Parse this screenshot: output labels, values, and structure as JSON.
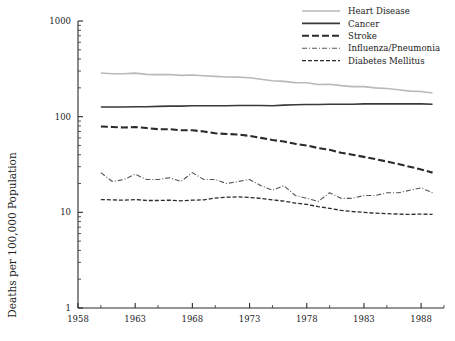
{
  "chart_data": {
    "type": "line",
    "title": "",
    "xlabel": "",
    "ylabel": "Deaths per 100,000 Population",
    "yscale": "log",
    "ylim": [
      1,
      1000
    ],
    "xlim": [
      1958,
      1990
    ],
    "grid": false,
    "legend_position": "top-right",
    "ytick_labels": [
      "1000",
      "100",
      "10",
      "1"
    ],
    "ytick_values": [
      1000,
      100,
      10,
      1
    ],
    "xtick_labels": [
      "1958",
      "1963",
      "1968",
      "1973",
      "1978",
      "1983",
      "1988"
    ],
    "xtick_values": [
      1958,
      1963,
      1968,
      1973,
      1978,
      1983,
      1988
    ],
    "x": [
      1960,
      1961,
      1962,
      1963,
      1964,
      1965,
      1966,
      1967,
      1968,
      1969,
      1970,
      1971,
      1972,
      1973,
      1974,
      1975,
      1976,
      1977,
      1978,
      1979,
      1980,
      1981,
      1982,
      1983,
      1984,
      1985,
      1986,
      1987,
      1988,
      1989
    ],
    "series": [
      {
        "name": "Heart Disease",
        "color": "#b9b9b9",
        "style": "solid",
        "values": [
          286,
          281,
          281,
          285,
          277,
          275,
          276,
          270,
          273,
          268,
          264,
          260,
          259,
          255,
          246,
          237,
          234,
          227,
          226,
          217,
          218,
          211,
          206,
          206,
          200,
          197,
          191,
          185,
          183,
          177
        ]
      },
      {
        "name": "Cancer",
        "color": "#3a3a3a",
        "style": "solid",
        "values": [
          126,
          126,
          126,
          127,
          127,
          128,
          129,
          129,
          130,
          130,
          130,
          130,
          131,
          131,
          131,
          130,
          132,
          133,
          134,
          134,
          135,
          135,
          135,
          136,
          136,
          136,
          136,
          136,
          136,
          135
        ]
      },
      {
        "name": "Stroke",
        "color": "#2a2a2a",
        "style": "dashed",
        "values": [
          79,
          78,
          77,
          78,
          76,
          74,
          74,
          72,
          72,
          70,
          67,
          66,
          65,
          63,
          60,
          57,
          55,
          52,
          50,
          47,
          45,
          42,
          40,
          38,
          36,
          34,
          32,
          30,
          28,
          26
        ]
      },
      {
        "name": "Influenza/Pneumonia",
        "color": "#555555",
        "style": "dashdot",
        "values": [
          26,
          21,
          22,
          25,
          22,
          22,
          23,
          21,
          26,
          22,
          22,
          20,
          21,
          22,
          19,
          17,
          19,
          15,
          14,
          13,
          16,
          14,
          14,
          15,
          15,
          16,
          16,
          17,
          18,
          16
        ]
      },
      {
        "name": "Diabetes Mellitus",
        "color": "#2a2a2a",
        "style": "finedash",
        "values": [
          13.6,
          13.5,
          13.4,
          13.6,
          13.3,
          13.3,
          13.4,
          13.2,
          13.4,
          13.5,
          14.1,
          14.4,
          14.5,
          14.3,
          14.0,
          13.5,
          13.1,
          12.5,
          12.1,
          11.5,
          11.0,
          10.5,
          10.2,
          10.0,
          9.8,
          9.7,
          9.6,
          9.5,
          9.6,
          9.5
        ]
      }
    ]
  },
  "legend": {
    "entries": [
      {
        "label": "Heart Disease"
      },
      {
        "label": "Cancer"
      },
      {
        "label": "Stroke"
      },
      {
        "label": "Influenza/Pneumonia"
      },
      {
        "label": "Diabetes Mellitus"
      }
    ]
  }
}
